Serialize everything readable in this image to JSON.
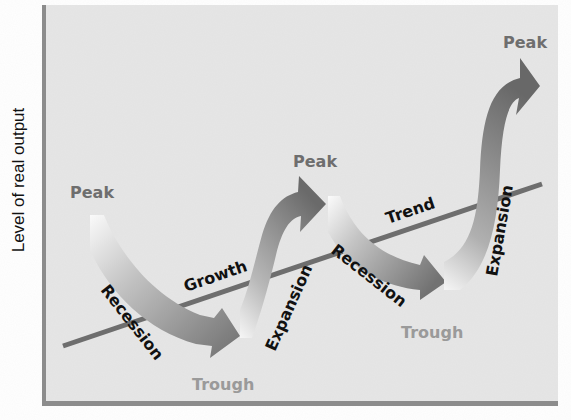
{
  "diagram": {
    "y_axis_label": "Level of real output",
    "trend_line": {
      "label_left": "Growth",
      "label_right": "Trend"
    },
    "phases": [
      {
        "name": "peak_1",
        "label": "Peak"
      },
      {
        "name": "recession_1",
        "label": "Recession"
      },
      {
        "name": "trough_1",
        "label": "Trough"
      },
      {
        "name": "expansion_1",
        "label": "Expansion"
      },
      {
        "name": "peak_2",
        "label": "Peak"
      },
      {
        "name": "recession_2",
        "label": "Recession"
      },
      {
        "name": "trough_2",
        "label": "Trough"
      },
      {
        "name": "expansion_2",
        "label": "Expansion"
      },
      {
        "name": "peak_3",
        "label": "Peak"
      }
    ],
    "colors": {
      "background": "#e6e6e6",
      "axis": "#8c8c8c",
      "trend_line": "#6e6e6e",
      "arrow_dark": "#6f6f6f",
      "arrow_light": "#f4f4f4",
      "peak_label": "#6e6e6e",
      "trough_label": "#9a9a9a",
      "phase_label": "#111111"
    }
  }
}
